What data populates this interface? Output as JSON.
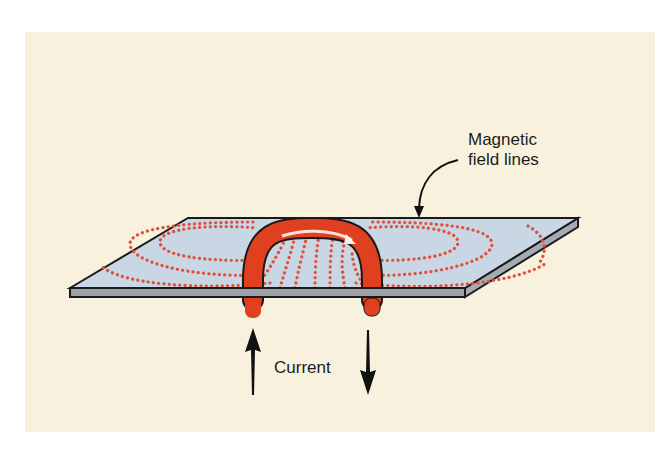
{
  "figure": {
    "labels": {
      "field_lines_line1": "Magnetic",
      "field_lines_line2": "field lines",
      "current": "Current"
    },
    "colors": {
      "background": "#f8f1dd",
      "plate_top": "#c9d6e3",
      "plate_edge": "#9ea3ab",
      "conductor": "#e0401f",
      "field_dots": "#e0503a",
      "outline": "#1a1a1a"
    },
    "elements": [
      {
        "name": "plate",
        "description": "flat sheet (parallelogram) in perspective"
      },
      {
        "name": "conductor-loop",
        "description": "red arched wire passing through the plate"
      },
      {
        "name": "field-lines",
        "description": "dotted red loops around the conductor on the plate"
      },
      {
        "name": "current-arrow-up",
        "description": "black arrow pointing up under left leg"
      },
      {
        "name": "current-arrow-down",
        "description": "black arrow pointing down under right leg"
      },
      {
        "name": "callout-arrow",
        "description": "curved arrow from label to field lines"
      }
    ]
  }
}
